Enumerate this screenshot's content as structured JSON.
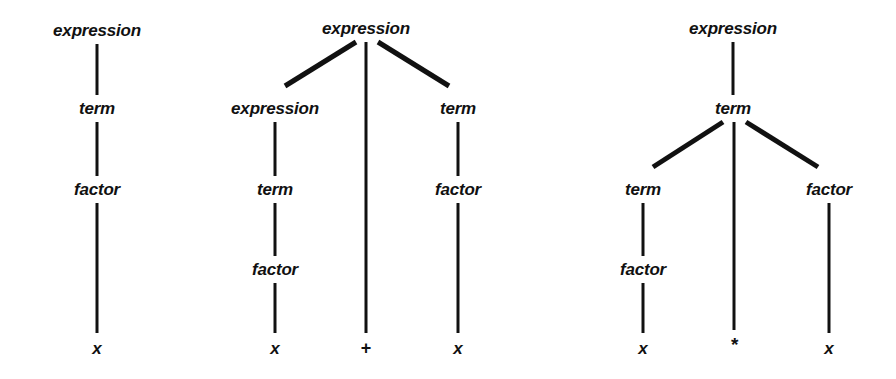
{
  "figure": {
    "background_color": "#ffffff",
    "ink_color": "#111111"
  },
  "trees": [
    {
      "id": "tree-1",
      "sentence": "x",
      "nodes": [
        {
          "id": "t1-expression",
          "label": "expression",
          "x": 97,
          "y": 30,
          "kind": "nonterminal"
        },
        {
          "id": "t1-term",
          "label": "term",
          "x": 97,
          "y": 108,
          "kind": "nonterminal"
        },
        {
          "id": "t1-factor",
          "label": "factor",
          "x": 97,
          "y": 189,
          "kind": "nonterminal"
        },
        {
          "id": "t1-x",
          "label": "x",
          "x": 97,
          "y": 348,
          "kind": "terminal"
        }
      ],
      "edges": [
        {
          "from": "t1-expression",
          "to": "t1-term",
          "x1": 97,
          "y1": 44,
          "x2": 97,
          "y2": 95,
          "weight": 3
        },
        {
          "from": "t1-term",
          "to": "t1-factor",
          "x1": 97,
          "y1": 122,
          "x2": 97,
          "y2": 176,
          "weight": 3
        },
        {
          "from": "t1-factor",
          "to": "t1-x",
          "x1": 97,
          "y1": 203,
          "x2": 97,
          "y2": 333,
          "weight": 3
        }
      ]
    },
    {
      "id": "tree-2",
      "sentence": "x + x",
      "nodes": [
        {
          "id": "t2-root-expression",
          "label": "expression",
          "x": 366,
          "y": 28,
          "kind": "nonterminal"
        },
        {
          "id": "t2-left-expression",
          "label": "expression",
          "x": 275,
          "y": 108,
          "kind": "nonterminal"
        },
        {
          "id": "t2-left-term",
          "label": "term",
          "x": 275,
          "y": 189,
          "kind": "nonterminal"
        },
        {
          "id": "t2-left-factor",
          "label": "factor",
          "x": 275,
          "y": 269,
          "kind": "nonterminal"
        },
        {
          "id": "t2-left-x",
          "label": "x",
          "x": 275,
          "y": 348,
          "kind": "terminal"
        },
        {
          "id": "t2-plus",
          "label": "+",
          "x": 366,
          "y": 348,
          "kind": "terminal"
        },
        {
          "id": "t2-right-term",
          "label": "term",
          "x": 458,
          "y": 108,
          "kind": "nonterminal"
        },
        {
          "id": "t2-right-factor",
          "label": "factor",
          "x": 458,
          "y": 189,
          "kind": "nonterminal"
        },
        {
          "id": "t2-right-x",
          "label": "x",
          "x": 458,
          "y": 348,
          "kind": "terminal"
        }
      ],
      "edges": [
        {
          "from": "t2-root-expression",
          "to": "t2-left-expression",
          "x1": 356,
          "y1": 42,
          "x2": 285,
          "y2": 86,
          "weight": 5
        },
        {
          "from": "t2-root-expression",
          "to": "t2-plus",
          "x1": 366,
          "y1": 42,
          "x2": 366,
          "y2": 333,
          "weight": 3
        },
        {
          "from": "t2-root-expression",
          "to": "t2-right-term",
          "x1": 378,
          "y1": 42,
          "x2": 449,
          "y2": 86,
          "weight": 5
        },
        {
          "from": "t2-left-expression",
          "to": "t2-left-term",
          "x1": 275,
          "y1": 122,
          "x2": 275,
          "y2": 176,
          "weight": 3
        },
        {
          "from": "t2-left-term",
          "to": "t2-left-factor",
          "x1": 275,
          "y1": 203,
          "x2": 275,
          "y2": 256,
          "weight": 3
        },
        {
          "from": "t2-left-factor",
          "to": "t2-left-x",
          "x1": 275,
          "y1": 283,
          "x2": 275,
          "y2": 333,
          "weight": 3
        },
        {
          "from": "t2-right-term",
          "to": "t2-right-factor",
          "x1": 458,
          "y1": 122,
          "x2": 458,
          "y2": 176,
          "weight": 3
        },
        {
          "from": "t2-right-factor",
          "to": "t2-right-x",
          "x1": 458,
          "y1": 203,
          "x2": 458,
          "y2": 333,
          "weight": 3
        }
      ]
    },
    {
      "id": "tree-3",
      "sentence": "x * x",
      "nodes": [
        {
          "id": "t3-expression",
          "label": "expression",
          "x": 733,
          "y": 28,
          "kind": "nonterminal"
        },
        {
          "id": "t3-root-term",
          "label": "term",
          "x": 733,
          "y": 108,
          "kind": "nonterminal"
        },
        {
          "id": "t3-left-term",
          "label": "term",
          "x": 643,
          "y": 189,
          "kind": "nonterminal"
        },
        {
          "id": "t3-left-factor",
          "label": "factor",
          "x": 643,
          "y": 269,
          "kind": "nonterminal"
        },
        {
          "id": "t3-left-x",
          "label": "x",
          "x": 643,
          "y": 348,
          "kind": "terminal"
        },
        {
          "id": "t3-star",
          "label": "*",
          "x": 734,
          "y": 344,
          "kind": "terminal"
        },
        {
          "id": "t3-right-factor",
          "label": "factor",
          "x": 829,
          "y": 189,
          "kind": "nonterminal"
        },
        {
          "id": "t3-right-x",
          "label": "x",
          "x": 829,
          "y": 348,
          "kind": "terminal"
        }
      ],
      "edges": [
        {
          "from": "t3-expression",
          "to": "t3-root-term",
          "x1": 733,
          "y1": 42,
          "x2": 733,
          "y2": 95,
          "weight": 3
        },
        {
          "from": "t3-root-term",
          "to": "t3-left-term",
          "x1": 723,
          "y1": 122,
          "x2": 653,
          "y2": 167,
          "weight": 5
        },
        {
          "from": "t3-root-term",
          "to": "t3-star",
          "x1": 734,
          "y1": 122,
          "x2": 734,
          "y2": 330,
          "weight": 3
        },
        {
          "from": "t3-root-term",
          "to": "t3-right-factor",
          "x1": 746,
          "y1": 122,
          "x2": 818,
          "y2": 167,
          "weight": 5
        },
        {
          "from": "t3-left-term",
          "to": "t3-left-factor",
          "x1": 643,
          "y1": 203,
          "x2": 643,
          "y2": 256,
          "weight": 3
        },
        {
          "from": "t3-left-factor",
          "to": "t3-left-x",
          "x1": 643,
          "y1": 283,
          "x2": 643,
          "y2": 333,
          "weight": 3
        },
        {
          "from": "t3-right-factor",
          "to": "t3-right-x",
          "x1": 829,
          "y1": 203,
          "x2": 829,
          "y2": 333,
          "weight": 3
        }
      ]
    }
  ]
}
